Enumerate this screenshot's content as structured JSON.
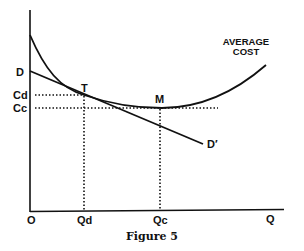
{
  "figure": {
    "caption": "Figure 5",
    "curve_label_line1": "AVERAGE",
    "curve_label_line2": "COST",
    "points": {
      "tangency": "T",
      "minimum": "M"
    },
    "axis_labels": {
      "origin": "O",
      "x_axis": "Q",
      "qd": "Qd",
      "qc": "Qc",
      "cd": "Cd",
      "cc": "Cc"
    },
    "demand_labels": {
      "start": "D",
      "end": "D′"
    },
    "colors": {
      "ink": "#111111",
      "background": "#ffffff"
    }
  }
}
